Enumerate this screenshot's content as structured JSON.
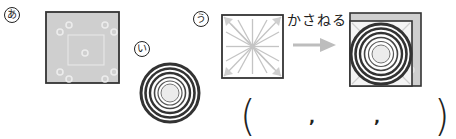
{
  "figures": [
    {
      "id": "a",
      "label": "あ",
      "shape": "gray-square-with-dots",
      "fill": "#cfcfcf",
      "border": "#333333"
    },
    {
      "id": "i",
      "label": "い",
      "shape": "concentric-circles",
      "ring_color": "#333333"
    },
    {
      "id": "u",
      "label": "う",
      "shape": "square-with-radiating-lines",
      "fill": "#ffffff",
      "border": "#333333"
    }
  ],
  "operation": {
    "label": "かさねる",
    "arrow_color": "#bdbdbd",
    "result": "stacked-squares-with-concentric-circles"
  },
  "answer": {
    "open_paren": "(",
    "separator_1": ",",
    "separator_2": ",",
    "close_paren": ")"
  }
}
